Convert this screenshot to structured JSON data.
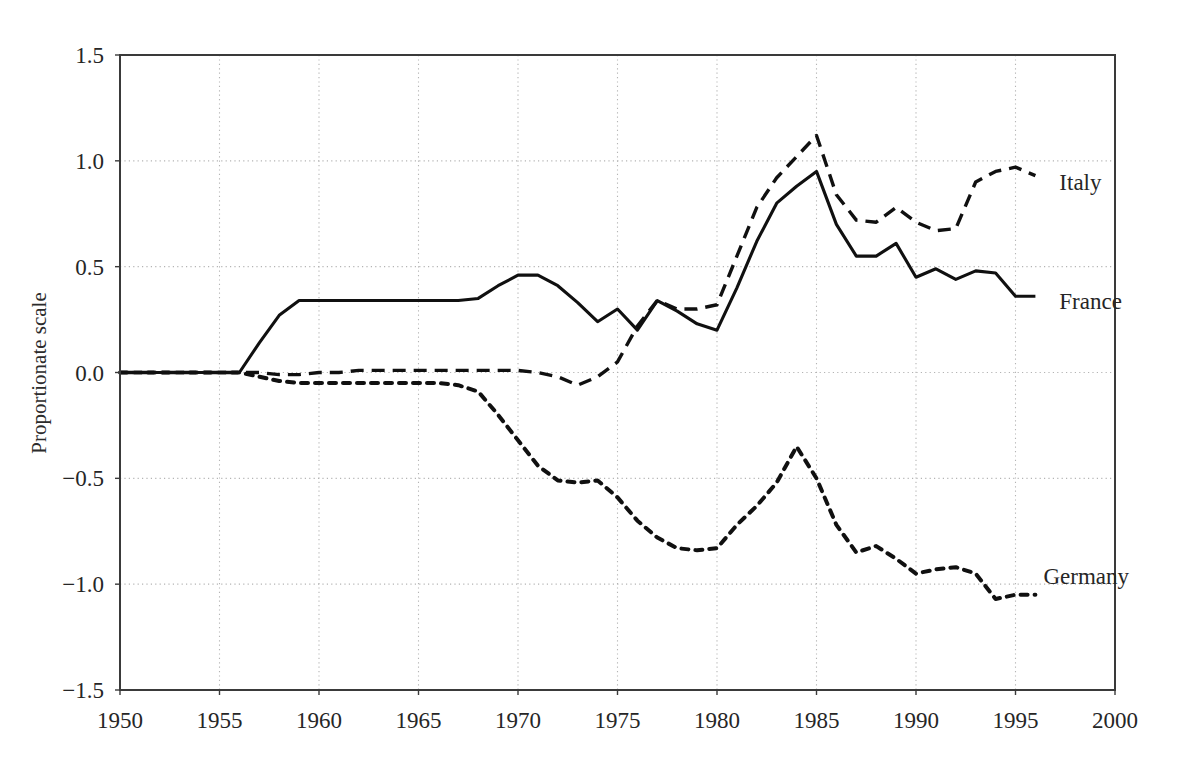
{
  "chart_data": {
    "type": "line",
    "title": "",
    "subtitle": "",
    "xlabel": "",
    "ylabel": "Proportionate scale",
    "xlim": [
      1950,
      2000
    ],
    "ylim": [
      -1.5,
      1.5
    ],
    "grid": true,
    "legend_position": "right-inline-labels",
    "xticks": [
      1950,
      1955,
      1960,
      1965,
      1970,
      1975,
      1980,
      1985,
      1990,
      1995,
      2000
    ],
    "xtick_labels": [
      "1950",
      "1955",
      "1960",
      "1965",
      "1970",
      "1975",
      "1980",
      "1985",
      "1990",
      "1995",
      "2000"
    ],
    "yticks": [
      -1.5,
      -1.0,
      -0.5,
      0.0,
      0.5,
      1.0,
      1.5
    ],
    "ytick_labels": [
      "−1.5",
      "−1.0",
      "−0.5",
      "0.0",
      "0.5",
      "1.0",
      "1.5"
    ],
    "series": [
      {
        "name": "Italy",
        "style": "dashed",
        "color": "#101010",
        "label_x": 1996.6,
        "label_y": 0.9,
        "x": [
          1950,
          1951,
          1952,
          1953,
          1954,
          1955,
          1956,
          1957,
          1958,
          1959,
          1960,
          1961,
          1962,
          1963,
          1964,
          1965,
          1966,
          1967,
          1968,
          1969,
          1970,
          1971,
          1972,
          1973,
          1974,
          1975,
          1976,
          1977,
          1978,
          1979,
          1980,
          1981,
          1982,
          1983,
          1984,
          1985,
          1986,
          1987,
          1988,
          1989,
          1990,
          1991,
          1992,
          1993,
          1994,
          1995,
          1996
        ],
        "y": [
          0.0,
          0.0,
          0.0,
          0.0,
          0.0,
          0.0,
          0.0,
          0.0,
          -0.01,
          -0.01,
          0.0,
          0.0,
          0.01,
          0.01,
          0.01,
          0.01,
          0.01,
          0.01,
          0.01,
          0.01,
          0.01,
          0.0,
          -0.02,
          -0.06,
          -0.02,
          0.05,
          0.22,
          0.34,
          0.3,
          0.3,
          0.32,
          0.55,
          0.78,
          0.92,
          1.02,
          1.12,
          0.84,
          0.72,
          0.71,
          0.78,
          0.71,
          0.67,
          0.68,
          0.9,
          0.95,
          0.97,
          0.93
        ]
      },
      {
        "name": "France",
        "style": "solid",
        "color": "#101010",
        "label_x": 1996.6,
        "label_y": 0.34,
        "x": [
          1950,
          1951,
          1952,
          1953,
          1954,
          1955,
          1956,
          1957,
          1958,
          1959,
          1960,
          1961,
          1962,
          1963,
          1964,
          1965,
          1966,
          1967,
          1968,
          1969,
          1970,
          1971,
          1972,
          1973,
          1974,
          1975,
          1976,
          1977,
          1978,
          1979,
          1980,
          1981,
          1982,
          1983,
          1984,
          1985,
          1986,
          1987,
          1988,
          1989,
          1990,
          1991,
          1992,
          1993,
          1994,
          1995,
          1996
        ],
        "y": [
          0.0,
          0.0,
          0.0,
          0.0,
          0.0,
          0.0,
          0.0,
          0.14,
          0.27,
          0.34,
          0.34,
          0.34,
          0.34,
          0.34,
          0.34,
          0.34,
          0.34,
          0.34,
          0.35,
          0.41,
          0.46,
          0.46,
          0.41,
          0.33,
          0.24,
          0.3,
          0.2,
          0.34,
          0.29,
          0.23,
          0.2,
          0.4,
          0.62,
          0.8,
          0.88,
          0.95,
          0.7,
          0.55,
          0.55,
          0.61,
          0.45,
          0.49,
          0.44,
          0.48,
          0.47,
          0.36,
          0.36
        ]
      },
      {
        "name": "Germany",
        "style": "dotted",
        "color": "#101010",
        "label_x": 1995.8,
        "label_y": -0.96,
        "x": [
          1950,
          1951,
          1952,
          1953,
          1954,
          1955,
          1956,
          1957,
          1958,
          1959,
          1960,
          1961,
          1962,
          1963,
          1964,
          1965,
          1966,
          1967,
          1968,
          1969,
          1970,
          1971,
          1972,
          1973,
          1974,
          1975,
          1976,
          1977,
          1978,
          1979,
          1980,
          1981,
          1982,
          1983,
          1984,
          1985,
          1986,
          1987,
          1988,
          1989,
          1990,
          1991,
          1992,
          1993,
          1994,
          1995,
          1996
        ],
        "y": [
          0.0,
          0.0,
          0.0,
          0.0,
          0.0,
          0.0,
          0.0,
          -0.02,
          -0.04,
          -0.05,
          -0.05,
          -0.05,
          -0.05,
          -0.05,
          -0.05,
          -0.05,
          -0.05,
          -0.06,
          -0.09,
          -0.2,
          -0.32,
          -0.44,
          -0.51,
          -0.52,
          -0.51,
          -0.59,
          -0.7,
          -0.78,
          -0.83,
          -0.84,
          -0.83,
          -0.72,
          -0.63,
          -0.52,
          -0.35,
          -0.5,
          -0.72,
          -0.85,
          -0.82,
          -0.88,
          -0.95,
          -0.93,
          -0.92,
          -0.95,
          -1.07,
          -1.05,
          -1.05
        ]
      }
    ]
  },
  "axes": {
    "ylabel": "Proportionate scale"
  }
}
